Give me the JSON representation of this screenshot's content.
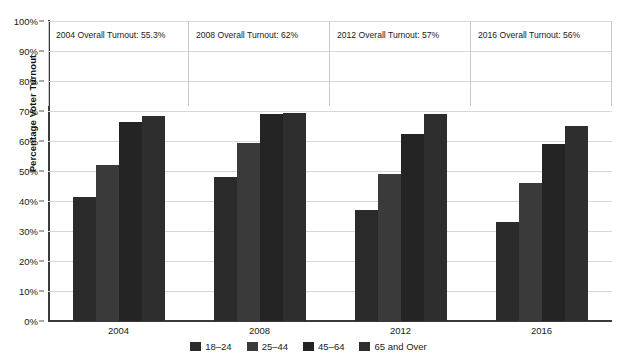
{
  "chart_data": {
    "type": "bar",
    "title": "",
    "xlabel": "",
    "ylabel": "Percentage Voter Turnout",
    "ylim": [
      0,
      100
    ],
    "ytick_labels": [
      "0%",
      "10%",
      "20%",
      "30%",
      "40%",
      "50%",
      "60%",
      "70%",
      "80%",
      "90%",
      "100%"
    ],
    "ytick_values": [
      0,
      10,
      20,
      30,
      40,
      50,
      60,
      70,
      80,
      90,
      100
    ],
    "grid": true,
    "legend_position": "bottom",
    "categories": [
      "2004",
      "2008",
      "2012",
      "2016"
    ],
    "series": [
      {
        "name": "18–24",
        "color": "#2b2b2b",
        "values": [
          41.5,
          48.0,
          37.0,
          33.0
        ]
      },
      {
        "name": "25–44",
        "color": "#3a3a3a",
        "values": [
          52.0,
          59.5,
          49.0,
          46.0
        ]
      },
      {
        "name": "45–64",
        "color": "#242424",
        "values": [
          66.5,
          69.0,
          62.5,
          59.0
        ]
      },
      {
        "name": "65 and Over",
        "color": "#2e2e2e",
        "values": [
          68.5,
          69.5,
          69.0,
          65.0
        ]
      }
    ],
    "annotations": [
      {
        "category": "2004",
        "text": "2004 Overall Turnout: 55.3%",
        "value": 55.3
      },
      {
        "category": "2008",
        "text": "2008 Overall Turnout: 62%",
        "value": 62
      },
      {
        "category": "2012",
        "text": "2012 Overall Turnout: 57%",
        "value": 57
      },
      {
        "category": "2016",
        "text": "2016 Overall Turnout: 56%",
        "value": 56
      }
    ]
  },
  "axis": {
    "y_title": "Percentage Voter Turnout"
  },
  "colors": {
    "gridline": "#d8d8d8",
    "axis": "#3a3a3a",
    "text": "#1a1a1a",
    "annotation_border": "#c9c9c9",
    "background": "#ffffff"
  }
}
